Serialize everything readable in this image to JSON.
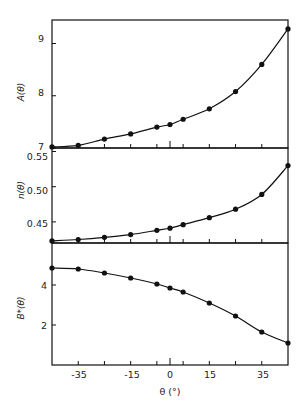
{
  "chart_data": [
    {
      "type": "line",
      "title": "",
      "xlabel": "θ (°)",
      "ylabel": "A(θ)",
      "x": [
        -45,
        -35,
        -25,
        -15,
        -5,
        0,
        5,
        15,
        25,
        35,
        45
      ],
      "values": [
        7.02,
        7.05,
        7.17,
        7.27,
        7.4,
        7.45,
        7.55,
        7.75,
        8.08,
        8.6,
        9.28
      ],
      "ylim": [
        7.0,
        9.45
      ],
      "yticks": [
        "7",
        "8",
        "9"
      ],
      "grid": false
    },
    {
      "type": "line",
      "title": "",
      "xlabel": "θ (°)",
      "ylabel": "n(θ)",
      "x": [
        -45,
        -35,
        -25,
        -15,
        -5,
        0,
        5,
        15,
        25,
        35,
        45
      ],
      "values": [
        0.423,
        0.425,
        0.428,
        0.432,
        0.438,
        0.441,
        0.446,
        0.456,
        0.468,
        0.489,
        0.53
      ],
      "ylim": [
        0.42,
        0.555
      ],
      "yticks": [
        "0.45",
        "0.50",
        "0.55"
      ],
      "grid": false
    },
    {
      "type": "line",
      "title": "",
      "xlabel": "θ (°)",
      "ylabel": "B*(θ)",
      "x": [
        -45,
        -35,
        -25,
        -15,
        -5,
        0,
        5,
        15,
        25,
        35,
        45
      ],
      "values": [
        4.85,
        4.8,
        4.6,
        4.35,
        4.05,
        3.85,
        3.65,
        3.1,
        2.45,
        1.65,
        1.1
      ],
      "ylim": [
        0,
        6.1
      ],
      "yticks": [
        "2",
        "4"
      ],
      "grid": false
    }
  ],
  "labels": {
    "panel1_ylabel": "A(θ)",
    "panel2_ylabel": "n(θ)",
    "panel3_ylabel": "B*(θ)",
    "xlabel": "θ (°)",
    "xticks": [
      "-35",
      "-15",
      "0",
      "15",
      "35"
    ],
    "p1_ticks": [
      "9",
      "8",
      "7"
    ],
    "p2_ticks": [
      "0.55",
      "0.50",
      "0.45"
    ],
    "p3_ticks": [
      "4",
      "2"
    ]
  }
}
